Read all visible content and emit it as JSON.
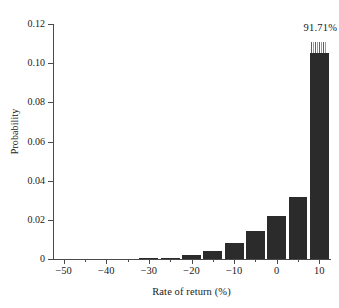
{
  "chart_data": {
    "type": "bar",
    "title": "",
    "xlabel": "Rate of return (%)",
    "ylabel": "Probability",
    "xlim": [
      -52.5,
      12.5
    ],
    "ylim": [
      0,
      0.12
    ],
    "grid": false,
    "legend": null,
    "bin_width": 5,
    "categories": [
      "-50",
      "-45",
      "-40",
      "-35",
      "-30",
      "-25",
      "-20",
      "-15",
      "-10",
      "-5",
      "0",
      "5",
      "10"
    ],
    "x": [
      -50,
      -45,
      -40,
      -35,
      -30,
      -25,
      -20,
      -15,
      -10,
      -5,
      0,
      5,
      10
    ],
    "values": [
      0.0,
      0.0,
      0.0,
      0.0,
      0.0002,
      0.0006,
      0.0018,
      0.0042,
      0.0082,
      0.0143,
      0.0221,
      0.0315,
      0.105
    ],
    "clipped_bar": {
      "x": 10,
      "drawn_value": 0.105,
      "is_truncated": true,
      "break_marker": "striped-axis-break"
    },
    "annotations": [
      {
        "text": "91.71%",
        "x": 10,
        "y": 0.118
      }
    ],
    "xticks_major": [
      -50,
      -40,
      -30,
      -20,
      -10,
      0,
      10
    ],
    "xticks_major_labels": [
      "−50",
      "−40",
      "−30",
      "−20",
      "−10",
      "0",
      "10"
    ],
    "xticks_minor": [
      -45,
      -35,
      -25,
      -15,
      -5,
      5
    ],
    "yticks": [
      0,
      0.02,
      0.04,
      0.06,
      0.08,
      0.1,
      0.12
    ],
    "ytick_labels": [
      "0",
      "0.02",
      "0.04",
      "0.06",
      "0.08",
      "0.10",
      "0.12"
    ],
    "colors": {
      "bar_fill": "#2b2b2b",
      "axis": "#4a4a4a",
      "text": "#1a1a1a",
      "background": "#ffffff",
      "break_marker": "#7a7a7a"
    }
  }
}
